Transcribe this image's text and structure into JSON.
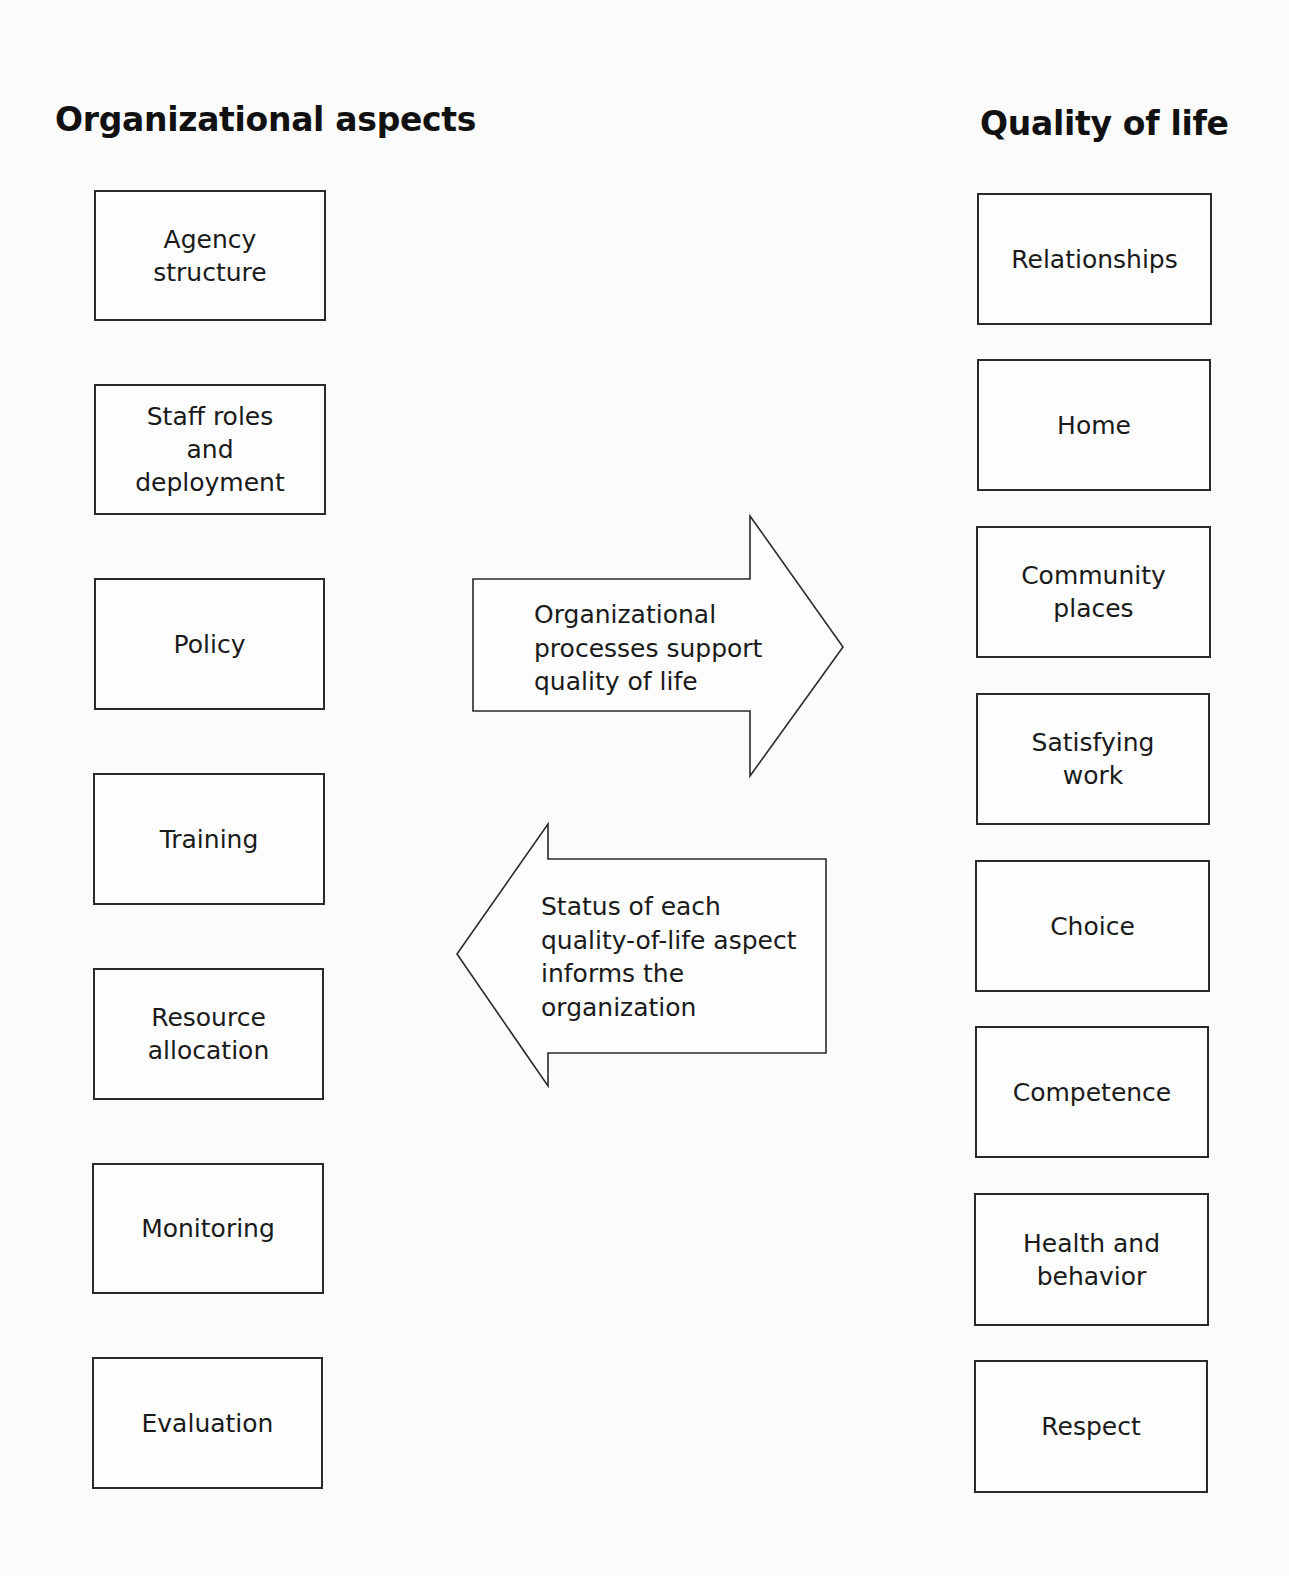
{
  "left_column": {
    "heading": "Organizational aspects",
    "boxes": [
      {
        "label": "Agency\nstructure"
      },
      {
        "label": "Staff roles\nand\ndeployment"
      },
      {
        "label": "Policy"
      },
      {
        "label": "Training"
      },
      {
        "label": "Resource\nallocation"
      },
      {
        "label": "Monitoring"
      },
      {
        "label": "Evaluation"
      }
    ]
  },
  "right_column": {
    "heading": "Quality of life",
    "boxes": [
      {
        "label": "Relationships"
      },
      {
        "label": "Home"
      },
      {
        "label": "Community\nplaces"
      },
      {
        "label": "Satisfying\nwork"
      },
      {
        "label": "Choice"
      },
      {
        "label": "Competence"
      },
      {
        "label": "Health and\nbehavior"
      },
      {
        "label": "Respect"
      }
    ]
  },
  "arrows": {
    "right_arrow": {
      "label": "Organizational\nprocesses support\nquality of life",
      "direction": "right"
    },
    "left_arrow": {
      "label": "Status of each\nquality-of-life aspect\ninforms the\norganization",
      "direction": "left"
    }
  }
}
